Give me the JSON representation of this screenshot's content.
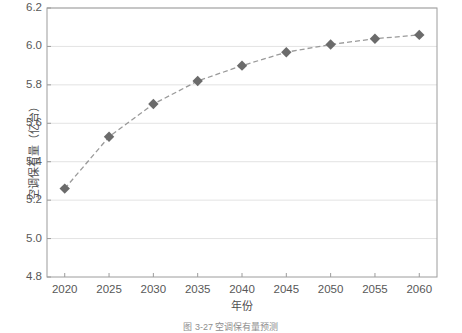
{
  "chart_data": {
    "type": "line",
    "title": "",
    "xlabel": "年份",
    "ylabel": "空调保有量（亿台）",
    "x": [
      2020,
      2025,
      2030,
      2035,
      2040,
      2045,
      2050,
      2055,
      2060
    ],
    "values": [
      5.26,
      5.53,
      5.7,
      5.82,
      5.9,
      5.97,
      6.01,
      6.04,
      6.06
    ],
    "series": [
      {
        "name": "空调保有量",
        "values": [
          5.26,
          5.53,
          5.7,
          5.82,
          5.9,
          5.97,
          6.01,
          6.04,
          6.06
        ]
      }
    ],
    "xlim": [
      2018,
      2062
    ],
    "ylim": [
      4.8,
      6.2
    ],
    "xticks": [
      2020,
      2025,
      2030,
      2035,
      2040,
      2045,
      2050,
      2055,
      2060
    ],
    "yticks": [
      4.8,
      5.0,
      5.2,
      5.4,
      5.6,
      5.8,
      6.0,
      6.2
    ],
    "xtick_labels": [
      "2020",
      "2025",
      "2030",
      "2035",
      "2040",
      "2045",
      "2050",
      "2055",
      "2060"
    ],
    "ytick_labels": [
      "4.8",
      "5.0",
      "5.2",
      "5.4",
      "5.6",
      "5.8",
      "6.0",
      "6.2"
    ],
    "grid": "horizontal",
    "legend": "none",
    "marker": "diamond",
    "line_style": "dashed",
    "colors": {
      "marker": "#6b6b6b",
      "line": "#9a9a9a",
      "grid": "#e3e3e3",
      "axis": "#9c9c9c",
      "text": "#585858",
      "background": "#ffffff"
    }
  },
  "caption": {
    "text": "图 3-27  空调保有量预测"
  }
}
